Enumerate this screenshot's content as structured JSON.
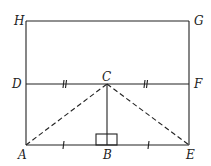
{
  "diagram": {
    "points": {
      "H": {
        "label": "H",
        "x": 26,
        "y": 21
      },
      "G": {
        "label": "G",
        "x": 189,
        "y": 21
      },
      "D": {
        "label": "D",
        "x": 26,
        "y": 84
      },
      "C": {
        "label": "C",
        "x": 107,
        "y": 84
      },
      "F": {
        "label": "F",
        "x": 189,
        "y": 84
      },
      "A": {
        "label": "A",
        "x": 26,
        "y": 145
      },
      "B": {
        "label": "B",
        "x": 107,
        "y": 145
      },
      "E": {
        "label": "E",
        "x": 189,
        "y": 145
      }
    },
    "solid_segments": [
      "HG",
      "HA",
      "GE",
      "DF",
      "AE",
      "CB"
    ],
    "dashed_segments": [
      "AC",
      "CE"
    ],
    "equal_marks": {
      "double_tick": [
        "DC",
        "CF"
      ],
      "single_tick": [
        "AB",
        "BE"
      ]
    },
    "right_angle_at": "B",
    "colors": {
      "line": "#222222",
      "background": "#ffffff"
    }
  }
}
